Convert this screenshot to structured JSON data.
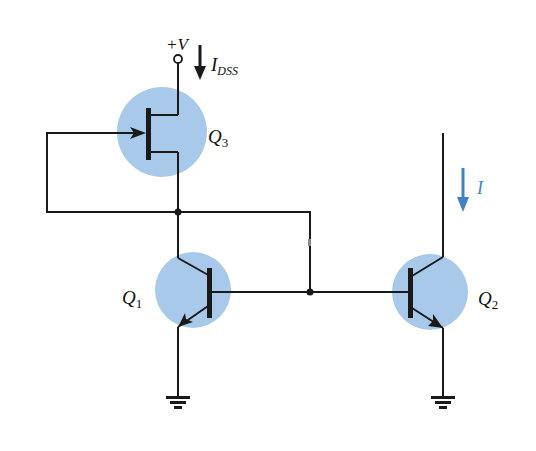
{
  "diagram": {
    "type": "circuit-schematic",
    "colors": {
      "wire": "#1a1a1a",
      "transistor_highlight": "#a9c9ea",
      "current_arrow_accent": "#3d84c6"
    },
    "supply": {
      "label": "+V",
      "current_label_main": "I",
      "current_label_sub": "DSS"
    },
    "transistors": [
      {
        "id": "Q3",
        "label_main": "Q",
        "label_sub": "3",
        "kind": "n-channel JFET"
      },
      {
        "id": "Q1",
        "label_main": "Q",
        "label_sub": "1",
        "kind": "npn BJT (diode-connected)"
      },
      {
        "id": "Q2",
        "label_main": "Q",
        "label_sub": "2",
        "kind": "npn BJT"
      }
    ],
    "output_current": {
      "label": "I"
    },
    "nodes": [
      {
        "id": "node-q3-source-q1-collector",
        "junction": true
      },
      {
        "id": "node-bases",
        "junction": true
      }
    ],
    "grounds": 2
  }
}
